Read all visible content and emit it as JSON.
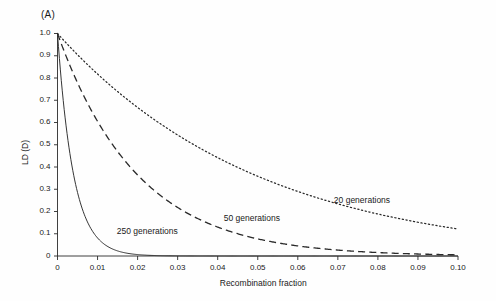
{
  "figure": {
    "panel_label": "(A)",
    "background_color": "#fefefe",
    "ink_color": "#2a2a2a"
  },
  "chart_data": {
    "type": "line",
    "title": "(A)",
    "xlabel": "Recombination fraction",
    "ylabel": "LD (D)",
    "xlim": [
      0,
      0.1
    ],
    "ylim": [
      0,
      1.0
    ],
    "grid": false,
    "legend_position": "inline-annotations",
    "xticks": [
      0,
      0.01,
      0.02,
      0.03,
      0.04,
      0.05,
      0.06,
      0.07,
      0.08,
      0.09,
      0.1
    ],
    "xticklabels": [
      "0",
      "0.01",
      "0.02",
      "0.03",
      "0.04",
      "0.05",
      "0.06",
      "0.07",
      "0.08",
      "0.09",
      "0.10"
    ],
    "yticks": [
      0,
      0.1,
      0.2,
      0.3,
      0.4,
      0.5,
      0.6,
      0.7,
      0.8,
      0.9,
      1.0
    ],
    "yticklabels": [
      "0",
      "0.1",
      "0.2",
      "0.3",
      "0.4",
      "0.5",
      "0.6",
      "0.7",
      "0.8",
      "0.9",
      "1.0"
    ],
    "x": [
      0,
      0.005,
      0.01,
      0.015,
      0.02,
      0.025,
      0.03,
      0.035,
      0.04,
      0.045,
      0.05,
      0.055,
      0.06,
      0.065,
      0.07,
      0.075,
      0.08,
      0.085,
      0.09,
      0.095,
      0.1
    ],
    "series": [
      {
        "name": "20 generations",
        "label": "20 generations",
        "style": "dotted",
        "values": [
          1.0,
          0.905,
          0.818,
          0.739,
          0.668,
          0.603,
          0.545,
          0.492,
          0.442,
          0.399,
          0.358,
          0.322,
          0.29,
          0.26,
          0.233,
          0.209,
          0.188,
          0.168,
          0.151,
          0.135,
          0.121
        ]
      },
      {
        "name": "50 generations",
        "label": "50 generations",
        "style": "dashed",
        "values": [
          1.0,
          0.778,
          0.605,
          0.47,
          0.364,
          0.282,
          0.218,
          0.168,
          0.13,
          0.1,
          0.077,
          0.059,
          0.045,
          0.035,
          0.027,
          0.02,
          0.016,
          0.012,
          0.009,
          0.007,
          0.005
        ]
      },
      {
        "name": "250 generations",
        "label": "250 generations",
        "style": "solid",
        "values": [
          1.0,
          0.285,
          0.081,
          0.023,
          0.0064,
          0.0018,
          0.0005,
          0.00014,
          4e-05,
          1e-05,
          0.0,
          0.0,
          0.0,
          0.0,
          0.0,
          0.0,
          0.0,
          0.0,
          0.0,
          0.0,
          0.0
        ]
      }
    ],
    "annotations": [
      {
        "text": "20 generations",
        "x": 0.069,
        "y": 0.245
      },
      {
        "text": "50 generations",
        "x": 0.0415,
        "y": 0.165
      },
      {
        "text": "250 generations",
        "x": 0.0148,
        "y": 0.107
      }
    ]
  }
}
